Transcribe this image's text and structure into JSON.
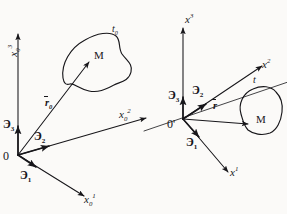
{
  "figure": {
    "background_color": "#fbfaf8",
    "ink_color": "#17161a",
    "width": 287,
    "height": 214
  },
  "left_frame": {
    "name": "reference-frame",
    "origin_label": "0",
    "axes": [
      {
        "key": "x3",
        "base": "x",
        "sub": "0",
        "sup": "3",
        "orientation": "up"
      },
      {
        "key": "x2",
        "base": "x",
        "sub": "0",
        "sup": "2",
        "orientation": "right"
      },
      {
        "key": "x1",
        "base": "x",
        "sub": "0",
        "sup": "1",
        "orientation": "down-left"
      }
    ],
    "basis": [
      {
        "key": "e3",
        "glyph": "Э",
        "sub": "3"
      },
      {
        "key": "e2",
        "glyph": "Э",
        "sub": "2"
      },
      {
        "key": "e1",
        "glyph": "Э",
        "sub": "1"
      }
    ],
    "position_vector": {
      "base": "r",
      "sub": "0",
      "overbar": true
    },
    "material_point": "M",
    "body_label": {
      "base": "t",
      "sub": "0"
    }
  },
  "right_frame": {
    "name": "current-frame",
    "origin_label": "0'",
    "axes": [
      {
        "key": "x3",
        "base": "x",
        "sub": "",
        "sup": "3",
        "orientation": "up"
      },
      {
        "key": "x2",
        "base": "x",
        "sub": "",
        "sup": "2",
        "orientation": "right"
      },
      {
        "key": "x1",
        "base": "x",
        "sub": "",
        "sup": "1",
        "orientation": "down-right"
      }
    ],
    "basis": [
      {
        "key": "e3",
        "glyph": "Э",
        "sub": "3"
      },
      {
        "key": "e2",
        "glyph": "Э",
        "sub": "2"
      },
      {
        "key": "e1",
        "glyph": "Э",
        "sub": "1"
      }
    ],
    "position_vector": {
      "base": "r",
      "sub": "",
      "overbar": true
    },
    "material_point": "M",
    "body_label": {
      "base": "t",
      "sub": ""
    }
  },
  "labels": {
    "left_x3": "x",
    "left_x3_sub": "0",
    "left_x3_sup": "3",
    "left_x2": "x",
    "left_x2_sub": "0",
    "left_x2_sup": "2",
    "left_x1": "x",
    "left_x1_sub": "0",
    "left_x1_sup": "1",
    "left_e3": "Э",
    "left_e3_sub": "3",
    "left_e2": "Э",
    "left_e2_sub": "2",
    "left_e1": "Э",
    "left_e1_sub": "1",
    "left_origin": "0",
    "left_r": "r",
    "left_r_sub": "0",
    "left_M": "M",
    "left_body": "t",
    "left_body_sub": "0",
    "right_x3": "x",
    "right_x3_sup": "3",
    "right_x2": "x",
    "right_x2_sup": "2",
    "right_x1": "x",
    "right_x1_sup": "1",
    "right_e3": "Э",
    "right_e3_sub": "3",
    "right_e2": "Э",
    "right_e2_sub": "2",
    "right_e1": "Э",
    "right_e1_sub": "1",
    "right_origin": "0'",
    "right_r": "r",
    "right_M": "M",
    "right_body": "t"
  }
}
